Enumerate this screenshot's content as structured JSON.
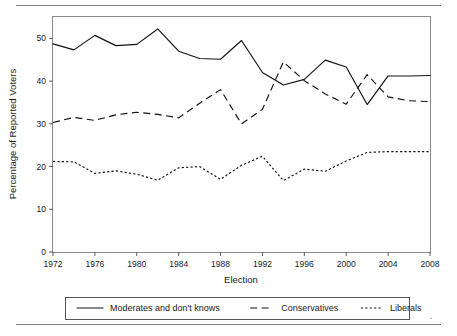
{
  "figure": {
    "top_rule": "horizontal-rule",
    "bottom_rule": "horizontal-rule"
  },
  "chart_data": {
    "type": "line",
    "title": "",
    "xlabel": "Election",
    "ylabel": "Percentage of Reported Voters",
    "xlim": [
      1972,
      2008
    ],
    "ylim": [
      0,
      55
    ],
    "xticks": [
      1972,
      1976,
      1980,
      1984,
      1988,
      1992,
      1996,
      2000,
      2004,
      2008
    ],
    "xticklabels": [
      "1972",
      "1976",
      "1980",
      "1984",
      "1988",
      "1992",
      "1996",
      "2000",
      "2004",
      "2008"
    ],
    "yticks": [
      0,
      10,
      20,
      30,
      40,
      50
    ],
    "yticklabels": [
      "0",
      "10",
      "20",
      "30",
      "40",
      "50"
    ],
    "grid": false,
    "legend_position": "below-axes",
    "x": [
      1972,
      1974,
      1976,
      1978,
      1980,
      1982,
      1984,
      1986,
      1988,
      1990,
      1992,
      1994,
      1996,
      1998,
      2000,
      2002,
      2004,
      2006,
      2008
    ],
    "series": [
      {
        "name": "Moderates and don't knows",
        "style": "solid",
        "color": "#111111",
        "values": [
          48.7,
          47.3,
          50.7,
          48.3,
          48.6,
          52.2,
          47.0,
          45.3,
          45.1,
          49.5,
          42.0,
          39.1,
          40.4,
          44.9,
          43.3,
          34.5,
          41.2,
          41.2,
          41.3
        ]
      },
      {
        "name": "Conservatives",
        "style": "dashed",
        "color": "#111111",
        "values": [
          30.3,
          31.5,
          30.8,
          32.1,
          32.7,
          32.2,
          31.4,
          34.8,
          38.0,
          30.0,
          33.4,
          44.5,
          40.1,
          37.0,
          34.6,
          41.5,
          36.3,
          35.4,
          35.2
        ]
      },
      {
        "name": "Liberals",
        "style": "dotted",
        "color": "#111111",
        "values": [
          21.2,
          21.1,
          18.4,
          19.0,
          18.2,
          16.8,
          19.7,
          20.0,
          17.0,
          20.3,
          22.4,
          16.7,
          19.4,
          18.9,
          21.3,
          23.3,
          23.5,
          23.5,
          23.5
        ]
      }
    ]
  },
  "legend": {
    "entries": [
      {
        "label": "Moderates and don't knows",
        "style": "solid"
      },
      {
        "label": "Conservatives",
        "style": "dashed"
      },
      {
        "label": "Liberals",
        "style": "dotted"
      }
    ]
  }
}
